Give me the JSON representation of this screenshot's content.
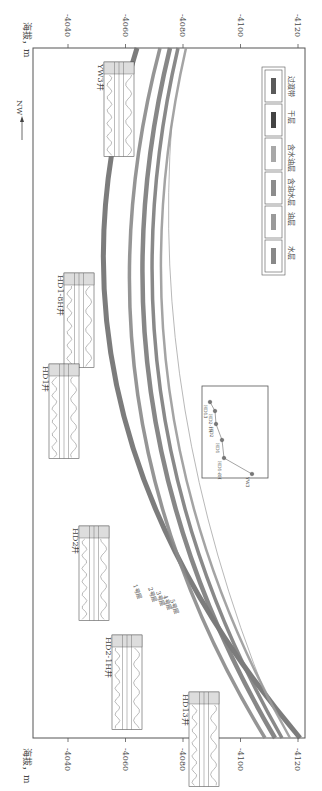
{
  "axis": {
    "label": "海拔，m",
    "ticks": [
      "-4040",
      "-4060",
      "-4080",
      "-4100",
      "-4120"
    ],
    "tick_values": [
      -4040,
      -4060,
      -4080,
      -4100,
      -4120
    ]
  },
  "direction": {
    "label": "NW"
  },
  "wells": [
    {
      "name": "YW3井"
    },
    {
      "name": "HD1-8H井"
    },
    {
      "name": "HD1井"
    },
    {
      "name": "HD2井"
    },
    {
      "name": "HD2-1H井"
    },
    {
      "name": "HD13井"
    }
  ],
  "layers": [
    {
      "label": "1号层",
      "color": "#6e6e6e"
    },
    {
      "label": "2号层",
      "color": "#8a8a8a"
    },
    {
      "label": "3号层",
      "color": "#7a7a7a"
    },
    {
      "label": "4号层",
      "color": "#7c7c7c"
    },
    {
      "label": "5号层",
      "color": "#9a9a9a"
    }
  ],
  "legend": {
    "items": [
      {
        "label": "过渡带",
        "color": "#5a5a5a"
      },
      {
        "label": "干层",
        "color": "#444444"
      },
      {
        "label": "含水油层",
        "color": "#a8a8a8"
      },
      {
        "label": "含油水层",
        "color": "#8c8c8c"
      },
      {
        "label": "油层",
        "color": "#9a9a9a"
      },
      {
        "label": "水层",
        "color": "#888888"
      }
    ]
  },
  "inset_map": {
    "wells": [
      "HD13",
      "HD2-1H",
      "HD2",
      "HD1",
      "HD1-8H",
      "YW3"
    ]
  }
}
